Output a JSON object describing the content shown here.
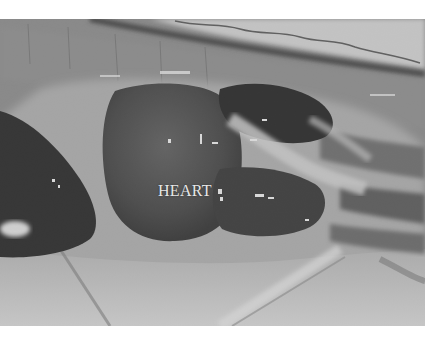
{
  "figure": {
    "type": "grayscale anatomical photograph",
    "labels": [
      {
        "text": "HEART",
        "x": 158,
        "y": 182
      }
    ]
  }
}
